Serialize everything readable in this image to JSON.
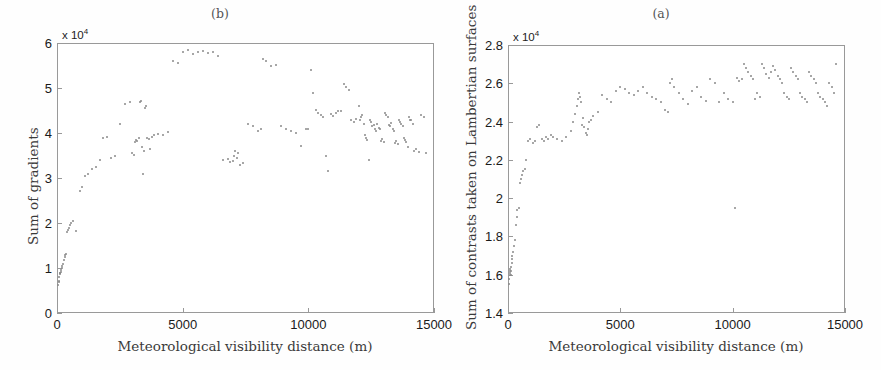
{
  "figure": {
    "background": "#fefefe",
    "point_color": "#8a8a8a",
    "axis_color": "#999999"
  },
  "panels": [
    {
      "id": "b",
      "title": "(b)",
      "xlabel": "Meteorological visibility distance (m)",
      "ylabel": "Sum of gradients",
      "exponent_label": "x 10",
      "exponent_value": "4",
      "xticks": [
        "0",
        "5000",
        "10000",
        "15000"
      ],
      "xtick_values": [
        0,
        5000,
        10000,
        15000
      ],
      "yticks": [
        "0",
        "1",
        "2",
        "3",
        "4",
        "5",
        "6"
      ],
      "ytick_values": [
        0,
        1,
        2,
        3,
        4,
        5,
        6
      ]
    },
    {
      "id": "a",
      "title": "(a)",
      "xlabel": "Meteorological visibility distance (m)",
      "ylabel": "Sum of contrasts taken on Lambertian surfaces",
      "exponent_label": "x 10",
      "exponent_value": "4",
      "xticks": [
        "0",
        "5000",
        "10000",
        "15000"
      ],
      "xtick_values": [
        0,
        5000,
        10000,
        15000
      ],
      "yticks": [
        "1.4",
        "1.6",
        "1.8",
        "2",
        "2.2",
        "2.4",
        "2.6",
        "2.8"
      ],
      "ytick_values": [
        1.4,
        1.6,
        1.8,
        2.0,
        2.2,
        2.4,
        2.6,
        2.8
      ]
    }
  ],
  "chart_data": [
    {
      "type": "scatter",
      "panel": "b",
      "title": "(b)",
      "xlabel": "Meteorological visibility distance (m)",
      "ylabel": "Sum of gradients",
      "y_exponent": 4,
      "xlim": [
        0,
        15000
      ],
      "ylim": [
        0,
        6
      ],
      "grid": false,
      "legend": null,
      "marker": "dot",
      "x": [
        40,
        60,
        70,
        85,
        100,
        110,
        130,
        150,
        170,
        190,
        210,
        240,
        260,
        300,
        330,
        360,
        400,
        430,
        470,
        520,
        560,
        640,
        760,
        900,
        980,
        1100,
        1250,
        1400,
        1550,
        1700,
        1850,
        2000,
        2150,
        2300,
        2500,
        2700,
        2900,
        3000,
        3050,
        3100,
        3150,
        3200,
        3250,
        3300,
        3350,
        3400,
        3420,
        3450,
        3500,
        3550,
        3600,
        3650,
        3700,
        3780,
        3850,
        4000,
        4200,
        4400,
        4600,
        4800,
        5000,
        5200,
        5400,
        5600,
        5800,
        6000,
        6200,
        6400,
        6600,
        6800,
        6900,
        7000,
        7050,
        7100,
        7150,
        7200,
        7300,
        7400,
        7600,
        7800,
        8000,
        8100,
        8200,
        8300,
        8500,
        8700,
        8900,
        9100,
        9300,
        9500,
        9700,
        9900,
        10000,
        10100,
        10200,
        10300,
        10400,
        10500,
        10600,
        10700,
        10800,
        10900,
        11000,
        11100,
        11200,
        11300,
        11400,
        11500,
        11600,
        11700,
        11800,
        11900,
        12000,
        12050,
        12100,
        12150,
        12200,
        12250,
        12300,
        12350,
        12400,
        12450,
        12500,
        12550,
        12600,
        12650,
        12700,
        12750,
        12800,
        12850,
        12900,
        12950,
        13000,
        13050,
        13100,
        13150,
        13200,
        13250,
        13300,
        13350,
        13400,
        13450,
        13500,
        13550,
        13600,
        13650,
        13700,
        13750,
        13800,
        13850,
        13900,
        13950,
        14000,
        14050,
        14100,
        14150,
        14200,
        14300,
        14400,
        14500,
        14600,
        14700
      ],
      "y": [
        0.63,
        0.68,
        0.72,
        0.8,
        0.86,
        0.88,
        0.9,
        0.92,
        0.95,
        1.0,
        1.05,
        1.1,
        1.18,
        1.25,
        1.3,
        1.32,
        1.8,
        1.85,
        1.9,
        1.95,
        2.0,
        2.05,
        1.82,
        2.72,
        2.8,
        3.05,
        3.1,
        3.2,
        3.25,
        3.4,
        3.9,
        3.92,
        3.45,
        3.5,
        4.2,
        4.65,
        4.7,
        3.55,
        3.52,
        3.8,
        3.85,
        3.82,
        3.9,
        4.7,
        4.72,
        3.7,
        3.1,
        3.6,
        4.55,
        4.6,
        3.88,
        3.86,
        3.65,
        3.92,
        3.95,
        3.98,
        3.96,
        4.02,
        5.6,
        5.55,
        5.8,
        5.85,
        5.75,
        5.8,
        5.82,
        5.78,
        5.8,
        5.72,
        3.4,
        3.42,
        3.35,
        3.38,
        3.5,
        3.6,
        3.45,
        3.55,
        3.3,
        3.33,
        4.2,
        4.15,
        4.05,
        4.08,
        5.65,
        5.6,
        5.48,
        5.52,
        4.15,
        4.1,
        4.05,
        4.0,
        3.72,
        4.08,
        4.1,
        5.4,
        4.9,
        4.52,
        4.45,
        4.4,
        4.35,
        3.5,
        3.15,
        4.42,
        4.38,
        4.45,
        4.5,
        4.48,
        5.1,
        5.02,
        4.95,
        4.3,
        4.25,
        4.32,
        4.6,
        4.28,
        4.35,
        4.4,
        4.2,
        3.95,
        3.9,
        3.85,
        3.4,
        4.3,
        4.25,
        4.15,
        4.18,
        4.1,
        4.05,
        4.2,
        4.12,
        4.08,
        3.82,
        3.86,
        3.8,
        4.45,
        4.4,
        4.35,
        4.18,
        4.15,
        4.22,
        4.1,
        4.05,
        3.78,
        3.82,
        3.75,
        4.3,
        4.25,
        4.2,
        4.15,
        3.88,
        3.85,
        3.8,
        3.7,
        4.35,
        4.3,
        4.28,
        4.2,
        3.6,
        3.65,
        3.58,
        4.4,
        4.35,
        3.55,
        4.42,
        4.5,
        4.2,
        4.1
      ]
    },
    {
      "type": "scatter",
      "panel": "a",
      "title": "(a)",
      "xlabel": "Meteorological visibility distance (m)",
      "ylabel": "Sum of contrasts taken on Lambertian surfaces",
      "y_exponent": 4,
      "xlim": [
        0,
        15000
      ],
      "ylim": [
        1.4,
        2.8
      ],
      "grid": false,
      "legend": null,
      "marker": "dot",
      "x": [
        40,
        55,
        70,
        85,
        95,
        105,
        115,
        125,
        140,
        160,
        180,
        200,
        230,
        260,
        300,
        340,
        380,
        420,
        470,
        520,
        570,
        620,
        680,
        740,
        820,
        900,
        1000,
        1100,
        1200,
        1300,
        1400,
        1500,
        1600,
        1700,
        1800,
        1900,
        2000,
        2200,
        2400,
        2600,
        2800,
        2900,
        3000,
        3050,
        3100,
        3150,
        3200,
        3250,
        3300,
        3350,
        3400,
        3450,
        3500,
        3550,
        3600,
        3700,
        3800,
        4000,
        4200,
        4400,
        4600,
        4800,
        5000,
        5200,
        5400,
        5600,
        5800,
        6000,
        6200,
        6400,
        6600,
        6800,
        7000,
        7100,
        7200,
        7300,
        7400,
        7600,
        7800,
        8000,
        8200,
        8400,
        8600,
        8800,
        9000,
        9200,
        9400,
        9600,
        9800,
        10000,
        10100,
        10200,
        10300,
        10400,
        10500,
        10600,
        10700,
        10800,
        10900,
        11000,
        11100,
        11200,
        11300,
        11400,
        11500,
        11600,
        11700,
        11800,
        11900,
        12000,
        12100,
        12200,
        12300,
        12400,
        12500,
        12600,
        12700,
        12800,
        12900,
        13000,
        13100,
        13200,
        13300,
        13400,
        13500,
        13600,
        13700,
        13800,
        13900,
        14000,
        14100,
        14200,
        14300,
        14400,
        14500,
        14600
      ],
      "y": [
        1.55,
        1.58,
        1.6,
        1.61,
        1.62,
        1.63,
        1.6,
        1.62,
        1.64,
        1.66,
        1.68,
        1.7,
        1.72,
        1.75,
        1.78,
        1.86,
        1.9,
        1.94,
        1.95,
        2.08,
        2.1,
        2.12,
        2.14,
        2.15,
        2.2,
        2.3,
        2.31,
        2.29,
        2.3,
        2.37,
        2.38,
        2.31,
        2.3,
        2.32,
        2.31,
        2.33,
        2.32,
        2.31,
        2.3,
        2.32,
        2.35,
        2.4,
        2.44,
        2.48,
        2.52,
        2.55,
        2.53,
        2.5,
        2.38,
        2.42,
        2.37,
        2.34,
        2.33,
        2.36,
        2.4,
        2.41,
        2.43,
        2.45,
        2.54,
        2.52,
        2.5,
        2.56,
        2.58,
        2.57,
        2.55,
        2.54,
        2.56,
        2.58,
        2.55,
        2.53,
        2.52,
        2.5,
        2.46,
        2.45,
        2.6,
        2.62,
        2.58,
        2.55,
        2.52,
        2.49,
        2.56,
        2.58,
        2.53,
        2.51,
        2.62,
        2.6,
        2.5,
        2.55,
        2.52,
        2.5,
        1.95,
        2.63,
        2.61,
        2.62,
        2.7,
        2.68,
        2.66,
        2.64,
        2.62,
        2.52,
        2.55,
        2.53,
        2.7,
        2.68,
        2.65,
        2.63,
        2.66,
        2.69,
        2.67,
        2.64,
        2.62,
        2.6,
        2.55,
        2.53,
        2.52,
        2.68,
        2.66,
        2.64,
        2.62,
        2.55,
        2.53,
        2.52,
        2.5,
        2.66,
        2.64,
        2.62,
        2.6,
        2.55,
        2.53,
        2.52,
        2.5,
        2.48,
        2.6,
        2.58,
        2.55,
        2.7,
        2.72,
        2.65,
        2.63
      ]
    }
  ]
}
